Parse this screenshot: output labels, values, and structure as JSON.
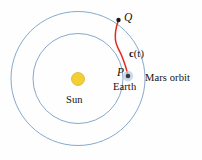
{
  "figure": {
    "background_color": "#fefefe",
    "width": 202,
    "height": 160
  },
  "colors": {
    "orbit_stroke": "#7a9ec4",
    "sun_fill": "#f2cf33",
    "sun_stroke": "#d8ab1f",
    "trajectory": "#e02b20",
    "earth_dot": "#3a3a3a",
    "earth_halo": "#b9cfe4",
    "point_marker": "#1a1a1a",
    "label_text": "#111111"
  },
  "orbits": [
    {
      "name": "mars-orbit",
      "center": {
        "x": 78,
        "y": 78.5
      },
      "radius": 67,
      "stroke_width": 0.9
    },
    {
      "name": "earth-orbit",
      "center": {
        "x": 78,
        "y": 78.5
      },
      "radius": 45,
      "stroke_width": 0.9
    }
  ],
  "sun": {
    "label": "Sun",
    "center": {
      "x": 78,
      "y": 79
    },
    "radius": 6.5
  },
  "earth": {
    "label": "Earth",
    "point_label": "P",
    "center": {
      "x": 128,
      "y": 76
    },
    "dot_radius": 2.3,
    "halo_radius": 5.2
  },
  "target_point": {
    "point_label": "Q",
    "center": {
      "x": 118.5,
      "y": 20
    },
    "dot_radius": 2.2
  },
  "trajectory": {
    "label": "c(t)",
    "label_bold_part": "c",
    "label_rest": "(t)",
    "stroke_width": 1.5,
    "path": "M 118.3 20.6 C 116.0 27.5 114.8 33.0 115.4 39.5 C 116.0 46.0 119.6 50.5 121.6 55.5 C 123.6 60.5 126.4 68.0 127.6 74.2"
  },
  "labels": {
    "q": "Q",
    "p": "P",
    "c_of_t": "c(t)",
    "earth": "Earth",
    "sun": "Sun",
    "mars_orbit": "Mars orbit"
  }
}
